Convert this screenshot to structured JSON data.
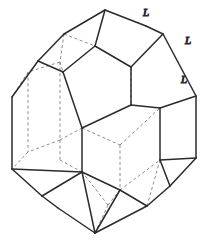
{
  "figure": {
    "name": "crystal-polyhedron",
    "type": "line-diagram",
    "background_color": "#ffffff",
    "visible_edge_color": "#2b2b2b",
    "hidden_edge_color": "#8c8c8c"
  },
  "labels": [
    {
      "id": "label-L-1",
      "text": "L",
      "x": 146,
      "y": 13
    },
    {
      "id": "label-L-2",
      "text": "L",
      "x": 188,
      "y": 41
    },
    {
      "id": "label-L-3",
      "text": "L",
      "x": 184,
      "y": 80
    }
  ],
  "geometry": {
    "visible_edges": [
      "M 105 10 L 146 26",
      "M 146 26 L 163 34",
      "M 163 34 L 196 96",
      "M 196 96 L 196 158",
      "M 196 158 L 170 186",
      "M 170 186 L 147 206",
      "M 147 206 L 95 233",
      "M 95 233 L 58 208",
      "M 58 208 L 42 196",
      "M 42 196 L 12 169",
      "M 12 169 L 12 97",
      "M 12 97 L 38 61",
      "M 38 61 L 64 34",
      "M 64 34 L 105 10",
      "M 105 10 L 95 46",
      "M 95 46 L 63 72",
      "M 63 72 L 38 61",
      "M 95 46 L 131 67",
      "M 131 67 L 163 34",
      "M 63 72 L 82 128",
      "M 82 128 L 131 105",
      "M 131 105 L 131 67",
      "M 131 105 L 160 108",
      "M 160 108 L 196 96",
      "M 160 108 L 160 160",
      "M 160 160 L 196 158",
      "M 160 160 L 170 186",
      "M 82 128 L 82 172",
      "M 82 172 L 42 196",
      "M 82 172 L 120 190",
      "M 120 190 L 147 206",
      "M 120 190 L 95 233",
      "M 82 172 L 95 233",
      "M 12 169 L 82 172"
    ],
    "hidden_edges": [
      "M 64 34 L 95 46",
      "M 64 34 L 60 62",
      "M 60 62 L 63 72",
      "M 60 62 L 28 72",
      "M 28 72 L 12 97",
      "M 131 67 L 95 46",
      "M 131 67 L 131 105",
      "M 60 62 L 60 140",
      "M 60 140 L 82 128",
      "M 60 140 L 28 152",
      "M 28 152 L 12 169",
      "M 60 140 L 60 160",
      "M 60 160 L 82 172",
      "M 82 128 L 120 145",
      "M 120 145 L 160 108",
      "M 120 145 L 120 190",
      "M 120 190 L 160 160",
      "M 28 72 L 28 152",
      "M 95 233 L 108 205",
      "M 108 205 L 120 190",
      "M 108 205 L 82 172",
      "M 147 206 L 160 160"
    ]
  }
}
